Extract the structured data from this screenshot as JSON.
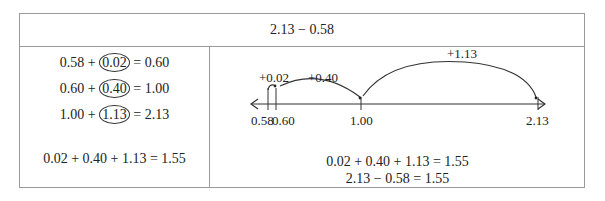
{
  "header": {
    "expression": "2.13 − 0.58"
  },
  "left_panel": {
    "steps": [
      {
        "start": "0.58",
        "op": "+",
        "jump": "0.02",
        "eq": "=",
        "result": "0.60"
      },
      {
        "start": "0.60",
        "op": "+",
        "jump": "0.40",
        "eq": "=",
        "result": "1.00"
      },
      {
        "start": "1.00",
        "op": "+",
        "jump": "1.13",
        "eq": "=",
        "result": "2.13"
      }
    ],
    "total": "0.02 + 0.40 + 1.13 = 1.55"
  },
  "number_line": {
    "ticks": [
      "0.58",
      "0.60",
      "1.00",
      "2.13"
    ],
    "jumps": [
      "+0.02",
      "+0.40",
      "+1.13"
    ]
  },
  "right_panel": {
    "total": "0.02 + 0.40 + 1.13 = 1.55",
    "difference": "2.13 − 0.58 = 1.55"
  }
}
